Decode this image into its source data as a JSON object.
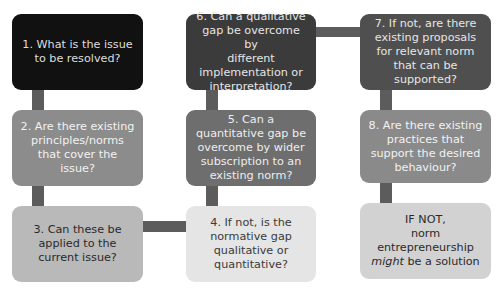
{
  "diagram": {
    "steps": [
      {
        "id": 1,
        "label": "1. What is the issue\nto be resolved?",
        "fill": "#111111",
        "text_color": "#dedede"
      },
      {
        "id": 2,
        "label": "2. Are there existing\nprinciples/norms\nthat cover the\nissue?",
        "fill": "#8c8c8c",
        "text_color": "#f2f2f2"
      },
      {
        "id": 3,
        "label": "3. Can these be\napplied to the\ncurrent issue?",
        "fill": "#b9b9b9",
        "text_color": "#2a2a2a"
      },
      {
        "id": 4,
        "label": "4. If not, is the\nnormative gap\nqualitative or\nquantitative?",
        "fill": "#e5e5e5",
        "text_color": "#3a3a3a"
      },
      {
        "id": 5,
        "label": "5. Can a\nquantitative gap be\novercome by wider\nsubscription to an\nexisting norm?",
        "fill": "#6e6e6e",
        "text_color": "#ededed"
      },
      {
        "id": 6,
        "label": "6. Can a qualitative\ngap be overcome by\ndifferent\nimplementation or\ninterpretation?",
        "fill": "#3b3b3b",
        "text_color": "#e6e6e6"
      },
      {
        "id": 7,
        "label": "7. If not, are there\nexisting proposals\nfor relevant norm\nthat can be\nsupported?",
        "fill": "#4f4f4f",
        "text_color": "#e6e6e6"
      },
      {
        "id": 8,
        "label": "8. Are there existing\npractices that\nsupport the desired\nbehaviour?",
        "fill": "#8a8a8a",
        "text_color": "#f2f2f2"
      },
      {
        "id": 9,
        "label_line1": "IF NOT,\nnorm\nentrepreneurship",
        "label_em": "might",
        "label_tail": " be a solution",
        "fill": "#d2d2d2",
        "text_color": "#2a2a2a"
      }
    ],
    "connector_color": "#5c5c5c"
  }
}
